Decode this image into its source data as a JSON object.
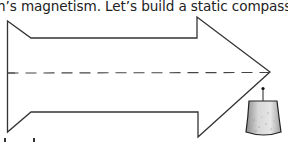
{
  "text": {
    "line1": "h’s magnetism.  Let’s build a static compass"
  },
  "figure": {
    "stroke_color": "#333333",
    "dash_color": "#444444",
    "weight_fill_light": "#e4e4e4",
    "weight_fill_dark": "#9a9a9a"
  }
}
